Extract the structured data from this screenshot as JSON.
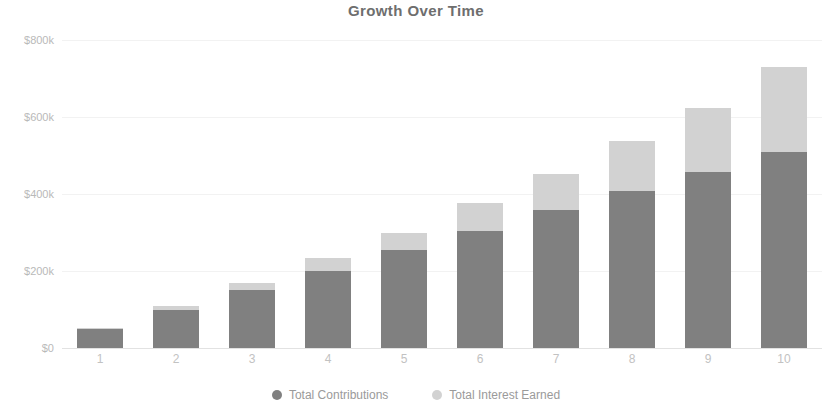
{
  "chart_data": {
    "type": "bar",
    "stacked": true,
    "title": "Growth Over Time",
    "xlabel": "",
    "ylabel": "",
    "grid": true,
    "legend_position": "bottom",
    "categories": [
      "1",
      "2",
      "3",
      "4",
      "5",
      "6",
      "7",
      "8",
      "9",
      "10"
    ],
    "ylim": [
      0,
      800000
    ],
    "yticks": [
      0,
      200000,
      400000,
      600000,
      800000
    ],
    "ytick_labels": [
      "$0",
      "$200k",
      "$400k",
      "$600k",
      "$800k"
    ],
    "series": [
      {
        "name": "Total Contributions",
        "color": "#808080",
        "values": [
          50000,
          100000,
          150000,
          200000,
          255000,
          305000,
          358000,
          408000,
          458000,
          508000
        ]
      },
      {
        "name": "Total Interest Earned",
        "color": "#d2d2d2",
        "values": [
          3000,
          8000,
          18000,
          33000,
          45000,
          72000,
          95000,
          130000,
          165000,
          222000
        ]
      }
    ],
    "totals": [
      53000,
      108000,
      168000,
      233000,
      300000,
      377000,
      453000,
      538000,
      623000,
      730000
    ]
  },
  "legend": {
    "items": [
      {
        "label": "Total Contributions",
        "marker": "circle-marker"
      },
      {
        "label": "Total Interest Earned",
        "marker": "circle-marker"
      }
    ]
  }
}
